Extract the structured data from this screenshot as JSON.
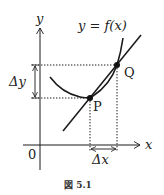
{
  "figure": {
    "caption": "図 5.1",
    "axes": {
      "x_label": "x",
      "y_label": "y",
      "origin_label": "0"
    },
    "curve_label": "y = f(x)",
    "points": [
      {
        "name": "P",
        "label": "P"
      },
      {
        "name": "Q",
        "label": "Q"
      }
    ],
    "increments": {
      "dx_label": "Δx",
      "dy_label": "Δy"
    },
    "colors": {
      "stroke": "#1a1a1a",
      "background": "#ffffff"
    }
  }
}
